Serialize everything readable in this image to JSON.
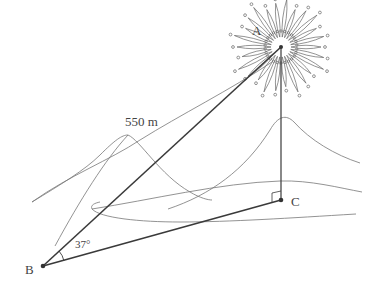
{
  "figure": {
    "type": "geometry word problem illustration",
    "points": {
      "A": {
        "label": "A",
        "x": 281,
        "y": 47,
        "description": "firework burst point"
      },
      "B": {
        "label": "B",
        "x": 43,
        "y": 266,
        "description": "observer"
      },
      "C": {
        "label": "C",
        "x": 281,
        "y": 200,
        "description": "ground point below A"
      }
    },
    "labels": {
      "distance_AB": "550 m",
      "angle_B": "37°",
      "point_A": "A",
      "point_B": "B",
      "point_C": "C"
    },
    "right_angle_at": "C",
    "colors": {
      "line": "#3a3a3a",
      "terrain": "#666666",
      "background": "#ffffff"
    }
  }
}
